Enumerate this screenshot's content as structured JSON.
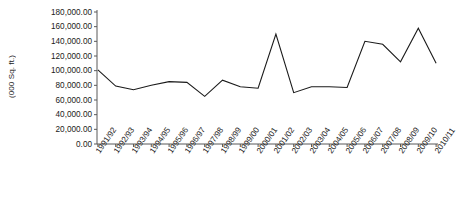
{
  "chart_data": {
    "type": "line",
    "title": "",
    "xlabel": "",
    "ylabel": "(000 Sq. ft.)",
    "ylim": [
      0,
      180000
    ],
    "ytick_step": 20000,
    "grid": false,
    "legend": "none",
    "categories": [
      "1991/92",
      "1992/93",
      "1993/94",
      "1994/95",
      "1995/96",
      "1996/97",
      "1997/98",
      "1998/99",
      "1999/00",
      "2000/01",
      "2001/02",
      "2002/03",
      "2003/04",
      "2004/05",
      "2005/06",
      "2006/07",
      "2007/08",
      "2008/09",
      "2009/10",
      "2010/11"
    ],
    "ytick_labels": [
      "180,000.00",
      "160,000.00",
      "140,000.00",
      "120,000.00",
      "100,000.00",
      "80,000.00",
      "60,000.00",
      "40,000.00",
      "20,000.00",
      "0.00"
    ],
    "series": [
      {
        "name": "Floor space",
        "color": "#1a1a1a",
        "values": [
          101000,
          79000,
          74000,
          80000,
          85000,
          84000,
          65000,
          87000,
          78000,
          76000,
          150000,
          70000,
          78000,
          78000,
          77000,
          140000,
          136000,
          112000,
          158000,
          110000
        ]
      }
    ]
  }
}
